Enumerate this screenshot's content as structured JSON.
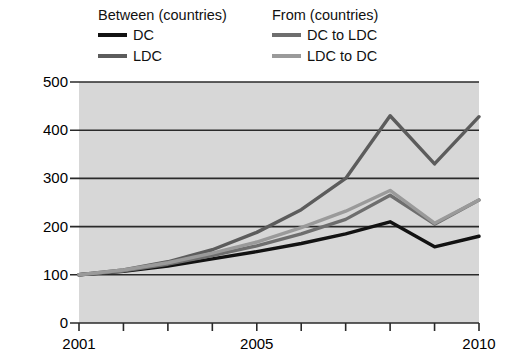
{
  "legend": {
    "groups": [
      {
        "title": "Between (countries)",
        "entries": [
          {
            "label": "DC",
            "color": "#121212"
          },
          {
            "label": "LDC",
            "color": "#5c5c5c"
          }
        ]
      },
      {
        "title": "From (countries)",
        "entries": [
          {
            "label": "DC to LDC",
            "color": "#6e6e6e"
          },
          {
            "label": "LDC to DC",
            "color": "#9a9a9a"
          }
        ]
      }
    ]
  },
  "axes": {
    "ylabel": "Exports, 2001=100",
    "yticks": [
      "0",
      "100",
      "200",
      "300",
      "400",
      "500"
    ],
    "xticks_labeled": [
      "2001",
      "2005",
      "2010"
    ]
  },
  "style": {
    "plot_background": "#d7d7d7",
    "gridline_color": "#2a2a2a",
    "axis_color": "#2a2a2a"
  },
  "chart_data": {
    "type": "line",
    "title": "",
    "xlabel": "",
    "ylabel": "Exports, 2001=100",
    "x": [
      2001,
      2002,
      2003,
      2004,
      2005,
      2006,
      2007,
      2008,
      2009,
      2010
    ],
    "xlim": [
      2001,
      2010
    ],
    "ylim": [
      0,
      500
    ],
    "yticks": [
      0,
      100,
      200,
      300,
      400,
      500
    ],
    "xticks": [
      2001,
      2002,
      2003,
      2004,
      2005,
      2006,
      2007,
      2008,
      2009,
      2010
    ],
    "xtick_labels_shown": [
      2001,
      2005,
      2010
    ],
    "grid": "horizontal",
    "legend_position": "above-plot",
    "series": [
      {
        "name": "DC",
        "group": "Between (countries)",
        "color": "#121212",
        "values": [
          100,
          107,
          118,
          133,
          148,
          165,
          185,
          210,
          158,
          180
        ]
      },
      {
        "name": "LDC",
        "group": "Between (countries)",
        "color": "#5c5c5c",
        "values": [
          100,
          110,
          127,
          152,
          188,
          235,
          300,
          430,
          330,
          428
        ]
      },
      {
        "name": "DC to LDC",
        "group": "From (countries)",
        "color": "#6e6e6e",
        "values": [
          100,
          108,
          122,
          140,
          160,
          185,
          215,
          265,
          205,
          255
        ]
      },
      {
        "name": "LDC to DC",
        "group": "From (countries)",
        "color": "#9a9a9a",
        "values": [
          100,
          110,
          125,
          145,
          168,
          198,
          232,
          275,
          207,
          255
        ]
      }
    ]
  }
}
